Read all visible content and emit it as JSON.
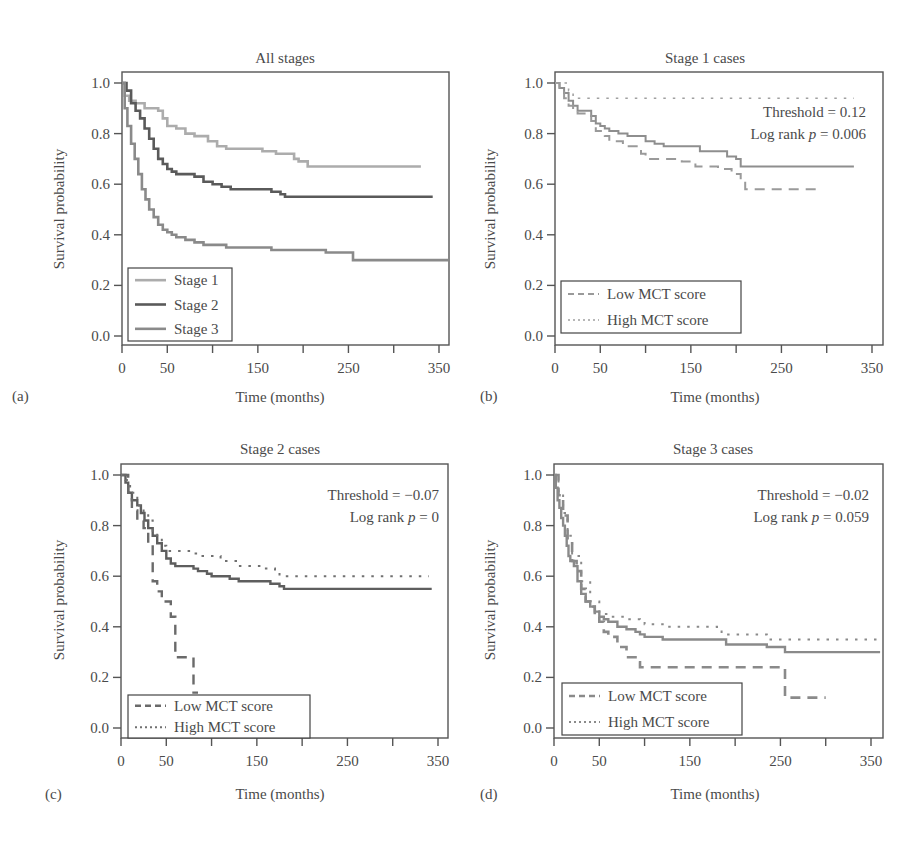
{
  "figure": {
    "panels_count": 4
  },
  "colors": {
    "axis": "#555555",
    "text": "#4a4a4a",
    "stage1": "#acacac",
    "stage2": "#5a5a5a",
    "stage3": "#8a8a8a",
    "low_mct": "#9a9a9a",
    "high_mct": "#a0a0a0",
    "overall": "#8e8e8e"
  },
  "chart_data": [
    {
      "panel": "(a)",
      "type": "line",
      "title": "All stages",
      "xlabel": "Time (months)",
      "ylabel": "Survival probability",
      "xlim": [
        0,
        360
      ],
      "ylim": [
        0,
        1
      ],
      "xticks": [
        0,
        50,
        100,
        150,
        200,
        250,
        300,
        350
      ],
      "xticklabels": [
        "0",
        "50",
        "150",
        "250",
        "350"
      ],
      "xticklabel_positions": [
        0,
        50,
        150,
        250,
        350
      ],
      "yticks": [
        0.0,
        0.2,
        0.4,
        0.6,
        0.8,
        1.0
      ],
      "yticklabels": [
        "0.0",
        "0.2",
        "0.4",
        "0.6",
        "0.8",
        "1.0"
      ],
      "legend": {
        "position": "bottom-left",
        "entries": [
          "Stage 1",
          "Stage 2",
          "Stage 3"
        ]
      },
      "annotations": [],
      "series": [
        {
          "name": "Stage 1",
          "style": "solid",
          "color": "#acacac",
          "width": 2.6,
          "x": [
            0,
            3,
            8,
            15,
            25,
            40,
            45,
            50,
            60,
            70,
            80,
            95,
            105,
            115,
            125,
            155,
            160,
            170,
            190,
            195,
            205,
            330
          ],
          "y": [
            1.0,
            0.95,
            0.93,
            0.92,
            0.9,
            0.89,
            0.86,
            0.83,
            0.82,
            0.8,
            0.79,
            0.77,
            0.75,
            0.74,
            0.74,
            0.73,
            0.73,
            0.72,
            0.7,
            0.69,
            0.67,
            0.67
          ]
        },
        {
          "name": "Stage 2",
          "style": "solid",
          "color": "#5a5a5a",
          "width": 2.6,
          "x": [
            0,
            5,
            10,
            15,
            20,
            25,
            30,
            35,
            40,
            45,
            50,
            55,
            60,
            70,
            80,
            90,
            100,
            110,
            120,
            140,
            165,
            175,
            180,
            343
          ],
          "y": [
            1.0,
            0.97,
            0.92,
            0.89,
            0.86,
            0.82,
            0.78,
            0.74,
            0.7,
            0.68,
            0.66,
            0.65,
            0.64,
            0.64,
            0.63,
            0.61,
            0.6,
            0.59,
            0.58,
            0.58,
            0.57,
            0.56,
            0.55,
            0.55
          ]
        },
        {
          "name": "Stage 3",
          "style": "solid",
          "color": "#8a8a8a",
          "width": 2.6,
          "x": [
            0,
            3,
            6,
            10,
            14,
            18,
            22,
            26,
            30,
            35,
            40,
            45,
            50,
            55,
            60,
            70,
            80,
            90,
            100,
            115,
            150,
            165,
            185,
            225,
            250,
            255,
            360
          ],
          "y": [
            1.0,
            0.9,
            0.83,
            0.76,
            0.7,
            0.64,
            0.58,
            0.54,
            0.5,
            0.47,
            0.44,
            0.42,
            0.41,
            0.4,
            0.39,
            0.38,
            0.37,
            0.36,
            0.36,
            0.35,
            0.35,
            0.34,
            0.34,
            0.33,
            0.33,
            0.3,
            0.3
          ]
        }
      ]
    },
    {
      "panel": "(b)",
      "type": "line",
      "title": "Stage 1 cases",
      "xlabel": "Time (months)",
      "ylabel": "Survival probability",
      "xlim": [
        0,
        360
      ],
      "ylim": [
        0,
        1
      ],
      "xticks": [
        0,
        50,
        100,
        150,
        200,
        250,
        300,
        350
      ],
      "xticklabels": [
        "0",
        "50",
        "150",
        "250",
        "350"
      ],
      "xticklabel_positions": [
        0,
        50,
        150,
        250,
        350
      ],
      "yticks": [
        0.0,
        0.2,
        0.4,
        0.6,
        0.8,
        1.0
      ],
      "yticklabels": [
        "0.0",
        "0.2",
        "0.4",
        "0.6",
        "0.8",
        "1.0"
      ],
      "legend": {
        "position": "bottom-left",
        "entries": [
          "Low MCT score",
          "High MCT score"
        ]
      },
      "annotations": [
        "Threshold = 0.12",
        "Log rank p = 0.006"
      ],
      "series": [
        {
          "name": "Overall",
          "style": "solid",
          "color": "#8e8e8e",
          "width": 2,
          "x": [
            0,
            5,
            10,
            15,
            20,
            25,
            35,
            40,
            45,
            50,
            55,
            60,
            70,
            80,
            95,
            100,
            110,
            120,
            145,
            160,
            180,
            190,
            200,
            205,
            330
          ],
          "y": [
            1.0,
            0.98,
            0.96,
            0.93,
            0.91,
            0.89,
            0.89,
            0.87,
            0.84,
            0.83,
            0.82,
            0.81,
            0.8,
            0.79,
            0.79,
            0.77,
            0.76,
            0.75,
            0.75,
            0.73,
            0.73,
            0.71,
            0.7,
            0.67,
            0.67
          ]
        },
        {
          "name": "Low MCT score",
          "style": "dashed",
          "color": "#9a9a9a",
          "width": 2,
          "x": [
            0,
            5,
            10,
            15,
            20,
            25,
            35,
            40,
            45,
            55,
            60,
            75,
            95,
            100,
            140,
            155,
            180,
            195,
            205,
            210,
            295
          ],
          "y": [
            1.0,
            0.97,
            0.94,
            0.91,
            0.89,
            0.88,
            0.88,
            0.85,
            0.81,
            0.79,
            0.77,
            0.75,
            0.72,
            0.7,
            0.69,
            0.67,
            0.66,
            0.64,
            0.61,
            0.58,
            0.58
          ]
        },
        {
          "name": "High MCT score",
          "style": "dotted",
          "color": "#a0a0a0",
          "width": 1.6,
          "x": [
            0,
            15,
            20,
            330
          ],
          "y": [
            1.0,
            0.97,
            0.94,
            0.94
          ]
        }
      ]
    },
    {
      "panel": "(c)",
      "type": "line",
      "title": "Stage 2 cases",
      "xlabel": "Time (months)",
      "ylabel": "Survival probability",
      "xlim": [
        0,
        360
      ],
      "ylim": [
        0,
        1
      ],
      "xticks": [
        0,
        50,
        100,
        150,
        200,
        250,
        300,
        350
      ],
      "xticklabels": [
        "0",
        "50",
        "150",
        "250",
        "350"
      ],
      "xticklabel_positions": [
        0,
        50,
        150,
        250,
        350
      ],
      "yticks": [
        0.0,
        0.2,
        0.4,
        0.6,
        0.8,
        1.0
      ],
      "yticklabels": [
        "0.0",
        "0.2",
        "0.4",
        "0.6",
        "0.8",
        "1.0"
      ],
      "legend": {
        "position": "bottom-left",
        "entries": [
          "Low MCT score",
          "High MCT score"
        ]
      },
      "annotations": [
        "Threshold = −0.07",
        "Log rank p = 0"
      ],
      "series": [
        {
          "name": "Overall",
          "style": "solid",
          "color": "#5e5e5e",
          "width": 2.4,
          "x": [
            0,
            5,
            8,
            12,
            18,
            22,
            26,
            30,
            35,
            40,
            45,
            50,
            55,
            60,
            70,
            80,
            85,
            95,
            100,
            110,
            120,
            130,
            165,
            175,
            180,
            343
          ],
          "y": [
            1.0,
            0.97,
            0.93,
            0.9,
            0.88,
            0.85,
            0.82,
            0.79,
            0.76,
            0.73,
            0.7,
            0.67,
            0.65,
            0.64,
            0.64,
            0.63,
            0.62,
            0.61,
            0.6,
            0.6,
            0.59,
            0.58,
            0.57,
            0.56,
            0.55,
            0.55
          ]
        },
        {
          "name": "Low MCT score",
          "style": "dashed",
          "color": "#6a6a6a",
          "width": 2.4,
          "x": [
            0,
            8,
            12,
            18,
            25,
            30,
            35,
            40,
            45,
            55,
            60,
            70,
            80,
            85
          ],
          "y": [
            1.0,
            0.93,
            0.86,
            0.82,
            0.79,
            0.73,
            0.58,
            0.54,
            0.5,
            0.44,
            0.28,
            0.28,
            0.14,
            0.14
          ]
        },
        {
          "name": "High MCT score",
          "style": "dotted",
          "color": "#707070",
          "width": 2,
          "x": [
            0,
            5,
            10,
            18,
            25,
            30,
            35,
            40,
            45,
            50,
            80,
            90,
            110,
            130,
            160,
            170,
            175,
            340
          ],
          "y": [
            1.0,
            0.98,
            0.93,
            0.88,
            0.85,
            0.82,
            0.78,
            0.75,
            0.72,
            0.7,
            0.69,
            0.68,
            0.66,
            0.64,
            0.63,
            0.62,
            0.6,
            0.6
          ]
        }
      ]
    },
    {
      "panel": "(d)",
      "type": "line",
      "title": "Stage 3 cases",
      "xlabel": "Time (months)",
      "ylabel": "Survival probability",
      "xlim": [
        0,
        360
      ],
      "ylim": [
        0,
        1
      ],
      "xticks": [
        0,
        50,
        100,
        150,
        200,
        250,
        300,
        350
      ],
      "xticklabels": [
        "0",
        "50",
        "150",
        "250",
        "350"
      ],
      "xticklabel_positions": [
        0,
        50,
        150,
        250,
        350
      ],
      "yticks": [
        0.0,
        0.2,
        0.4,
        0.6,
        0.8,
        1.0
      ],
      "yticklabels": [
        "0.0",
        "0.2",
        "0.4",
        "0.6",
        "0.8",
        "1.0"
      ],
      "legend": {
        "position": "bottom-left",
        "entries": [
          "Low MCT score",
          "High MCT score"
        ]
      },
      "annotations": [
        "Threshold = −0.02",
        "Log rank p = 0.059"
      ],
      "series": [
        {
          "name": "Overall",
          "style": "solid",
          "color": "#8a8a8a",
          "width": 2.4,
          "x": [
            0,
            2,
            4,
            6,
            8,
            10,
            12,
            14,
            16,
            18,
            22,
            26,
            30,
            35,
            40,
            45,
            50,
            55,
            60,
            70,
            80,
            90,
            95,
            100,
            120,
            185,
            190,
            230,
            235,
            250,
            255,
            360
          ],
          "y": [
            1.0,
            0.95,
            0.9,
            0.87,
            0.83,
            0.8,
            0.76,
            0.72,
            0.68,
            0.66,
            0.64,
            0.58,
            0.53,
            0.5,
            0.48,
            0.46,
            0.44,
            0.43,
            0.42,
            0.4,
            0.39,
            0.38,
            0.37,
            0.36,
            0.35,
            0.35,
            0.33,
            0.33,
            0.32,
            0.32,
            0.3,
            0.3
          ]
        },
        {
          "name": "Low MCT score",
          "style": "dashed",
          "color": "#8a8a8a",
          "width": 2.6,
          "x": [
            0,
            5,
            10,
            15,
            20,
            25,
            30,
            35,
            40,
            45,
            50,
            55,
            60,
            70,
            80,
            90,
            95,
            250,
            255,
            300
          ],
          "y": [
            1.0,
            0.92,
            0.84,
            0.74,
            0.66,
            0.62,
            0.55,
            0.5,
            0.48,
            0.44,
            0.42,
            0.38,
            0.36,
            0.32,
            0.28,
            0.26,
            0.24,
            0.24,
            0.12,
            0.12
          ]
        },
        {
          "name": "High MCT score",
          "style": "dotted",
          "color": "#8a8a8a",
          "width": 2,
          "x": [
            0,
            5,
            10,
            15,
            20,
            30,
            40,
            50,
            60,
            80,
            95,
            100,
            120,
            180,
            185,
            230,
            235,
            360
          ],
          "y": [
            1.0,
            0.93,
            0.85,
            0.76,
            0.68,
            0.58,
            0.5,
            0.45,
            0.44,
            0.43,
            0.42,
            0.41,
            0.4,
            0.39,
            0.37,
            0.37,
            0.35,
            0.35
          ]
        }
      ]
    }
  ]
}
